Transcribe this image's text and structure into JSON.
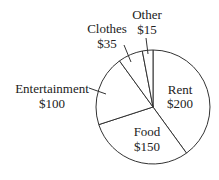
{
  "chart_data": {
    "type": "pie",
    "title": "",
    "start_angle_deg": 0,
    "direction": "clockwise",
    "categories": [
      "Rent",
      "Food",
      "Entertainment",
      "Clothes",
      "Other"
    ],
    "values": [
      200,
      150,
      100,
      35,
      15
    ],
    "value_labels": [
      "$200",
      "$150",
      "$100",
      "$35",
      "$15"
    ],
    "total": 500,
    "slice_fill": "#ffffff",
    "stroke_color": "#333333",
    "legend": "none"
  },
  "labels": {
    "rent": {
      "name": "Rent",
      "value": "$200"
    },
    "food": {
      "name": "Food",
      "value": "$150"
    },
    "entertainment": {
      "name": "Entertainment",
      "value": "$100"
    },
    "clothes": {
      "name": "Clothes",
      "value": "$35"
    },
    "other": {
      "name": "Other",
      "value": "$15"
    }
  }
}
